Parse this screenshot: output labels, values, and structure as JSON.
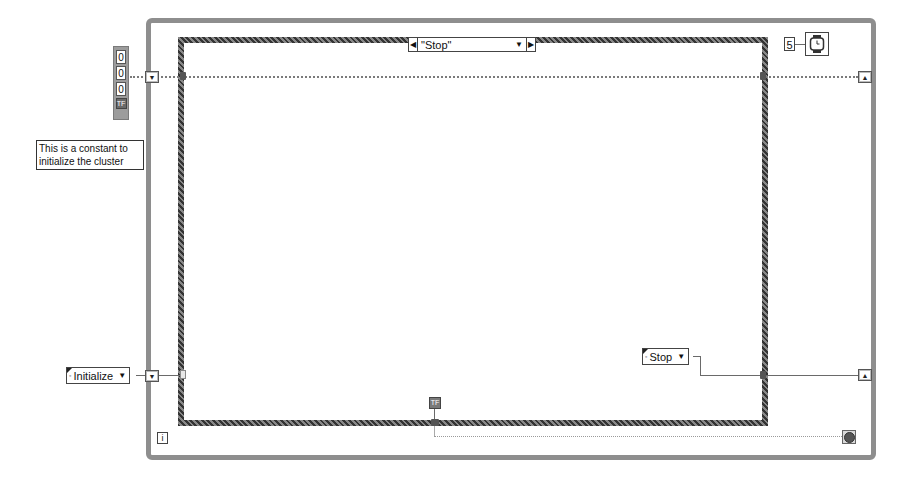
{
  "diagram": {
    "case_selector": {
      "label": "\"Stop\"",
      "left_arrow": "◀",
      "right_arrow": "▶",
      "dropdown": "▼"
    },
    "cluster_constant": {
      "values": [
        "0",
        "0",
        "0"
      ],
      "boolean": "TF"
    },
    "comment": {
      "text": "This is a constant to initialize the cluster"
    },
    "initialize_enum": {
      "label": "Initialize",
      "dropdown": "▼",
      "dot": "◦"
    },
    "stop_enum": {
      "label": "Stop",
      "dropdown": "▼",
      "dot": "◦"
    },
    "wait_ms_constant": "5",
    "iteration_terminal": "i",
    "true_constant": "TF",
    "shift_register_glyph_left": "▼",
    "shift_register_glyph_right": "▲",
    "colors": {
      "frame": "#8e8e8e",
      "case_border": "#4a4a4a",
      "wire": "#7a7a7a",
      "background": "#ffffff"
    }
  }
}
